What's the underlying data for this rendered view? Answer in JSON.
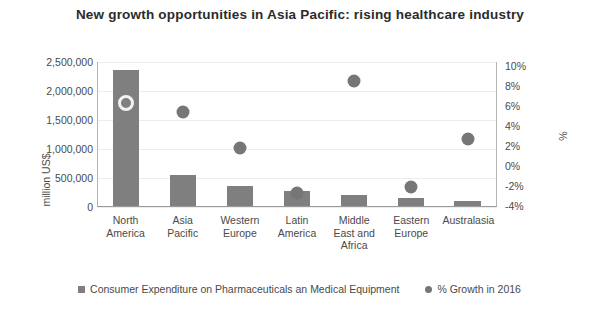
{
  "chart_data": {
    "type": "bar",
    "title": "New growth opportunities in Asia Pacific: rising healthcare industry",
    "categories": [
      "North America",
      "Asia Pacific",
      "Western Europe",
      "Latin America",
      "Middle East and Africa",
      "Eastern Europe",
      "Australasia"
    ],
    "series": [
      {
        "name": "Consumer Expenditure on Pharmaceuticals an Medical Equipment",
        "type": "bar",
        "axis": "left",
        "color": "#7f7f7f",
        "values": [
          2360000,
          560000,
          360000,
          275000,
          210000,
          160000,
          105000
        ]
      },
      {
        "name": "% Growth in 2016",
        "type": "scatter",
        "axis": "right",
        "color": "#767676",
        "values": [
          6.0,
          5.2,
          1.7,
          -2.6,
          8.2,
          -2.1,
          2.6
        ]
      }
    ],
    "xlabel": "",
    "ylabel": "million US$",
    "ylabel_right": "%",
    "ylim": [
      0,
      2500000
    ],
    "ylim_right": [
      -4,
      10
    ],
    "yticks": [
      0,
      500000,
      1000000,
      1500000,
      2000000,
      2500000
    ],
    "yticks_right": [
      -4,
      -2,
      0,
      2,
      4,
      6,
      8,
      10
    ],
    "grid": true,
    "legend_position": "bottom"
  },
  "axes": {
    "left": {
      "title": "million US$",
      "tick_labels": [
        "2,500,000",
        "2,000,000",
        "1,500,000",
        "1,000,000",
        "500,000",
        "0"
      ]
    },
    "right": {
      "title": "%",
      "tick_labels": [
        "10%",
        "8%",
        "6%",
        "4%",
        "2%",
        "0%",
        "-2%",
        "-4%"
      ]
    }
  },
  "legend": {
    "items": [
      {
        "label": "Consumer Expenditure on Pharmaceuticals an Medical Equipment",
        "marker": "square-swatch-icon"
      },
      {
        "label": "% Growth in 2016",
        "marker": "dot-swatch-icon"
      }
    ]
  }
}
